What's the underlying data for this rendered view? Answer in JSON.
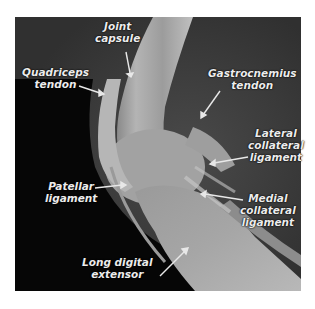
{
  "figure": {
    "type": "radiograph",
    "colors": {
      "background": "#ffffff",
      "label_text": "#ececec",
      "arrow": "#e8e8e8",
      "soft_tissue": "#3c3c3c",
      "dark_region": "#050505",
      "bone": "#a8a8a8"
    },
    "labels": [
      {
        "id": "joint-capsule",
        "lines": [
          "Joint",
          "capsule"
        ]
      },
      {
        "id": "quadriceps-tendon",
        "lines": [
          "Quadriceps",
          "tendon"
        ]
      },
      {
        "id": "gastrocnemius-tendon",
        "lines": [
          "Gastrocnemius",
          "tendon"
        ]
      },
      {
        "id": "lateral-collateral-ligament",
        "lines": [
          "Lateral",
          "collateral",
          "ligament"
        ]
      },
      {
        "id": "patellar-ligament",
        "lines": [
          "Patellar",
          "ligament"
        ]
      },
      {
        "id": "medial-collateral-ligament",
        "lines": [
          "Medial",
          "collateral",
          "ligament"
        ]
      },
      {
        "id": "long-digital-extensor",
        "lines": [
          "Long digital",
          "extensor"
        ]
      }
    ]
  }
}
